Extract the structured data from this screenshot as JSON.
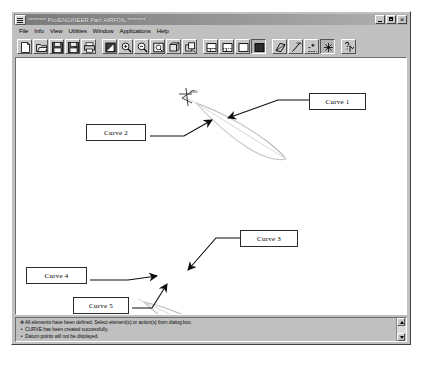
{
  "window": {
    "title": "******** Pro/ENGINEER Part: AIRFOIL ********",
    "sysmenu_name": "system-menu",
    "buttons": {
      "minimize": "_",
      "maximize": "□",
      "close": "×"
    }
  },
  "menubar": {
    "items": [
      {
        "label": "File"
      },
      {
        "label": "Info"
      },
      {
        "label": "View"
      },
      {
        "label": "Utilities"
      },
      {
        "label": "Window"
      },
      {
        "label": "Applications"
      },
      {
        "label": "Help"
      }
    ]
  },
  "toolbar": {
    "groups": [
      {
        "buttons": [
          {
            "icon": "new-file-icon",
            "tooltip": "New"
          },
          {
            "icon": "open-folder-icon",
            "tooltip": "Open"
          },
          {
            "icon": "save-icon",
            "tooltip": "Save"
          },
          {
            "icon": "save-as-icon",
            "tooltip": "Save As"
          },
          {
            "icon": "print-icon",
            "tooltip": "Print"
          }
        ]
      },
      {
        "buttons": [
          {
            "icon": "repaint-icon",
            "tooltip": "Repaint"
          },
          {
            "icon": "zoom-in-icon",
            "tooltip": "Zoom In"
          },
          {
            "icon": "zoom-out-icon",
            "tooltip": "Zoom Out"
          },
          {
            "icon": "refit-icon",
            "tooltip": "Refit"
          },
          {
            "icon": "reorient-icon",
            "tooltip": "Reorient"
          },
          {
            "icon": "saved-view-icon",
            "tooltip": "Saved View"
          }
        ]
      },
      {
        "buttons": [
          {
            "icon": "wireframe-icon",
            "tooltip": "Wireframe"
          },
          {
            "icon": "hidden-line-icon",
            "tooltip": "Hidden Line"
          },
          {
            "icon": "no-hidden-icon",
            "tooltip": "No Hidden"
          },
          {
            "icon": "shading-icon",
            "tooltip": "Shading",
            "pressed": true
          }
        ]
      },
      {
        "buttons": [
          {
            "icon": "datum-plane-icon",
            "tooltip": "Datum Planes"
          },
          {
            "icon": "datum-axis-icon",
            "tooltip": "Datum Axes"
          },
          {
            "icon": "datum-point-icon",
            "tooltip": "Datum Points"
          },
          {
            "icon": "datum-csys-icon",
            "tooltip": "Coordinate Systems",
            "pressed": true
          }
        ]
      },
      {
        "buttons": [
          {
            "icon": "context-help-icon",
            "tooltip": "Help"
          }
        ]
      }
    ]
  },
  "graphics": {
    "csys_label": "CS0",
    "callouts": [
      {
        "id": "callout-1",
        "label": "Curve 1"
      },
      {
        "id": "callout-2",
        "label": "Curve 2"
      },
      {
        "id": "callout-3",
        "label": "Curve 3"
      },
      {
        "id": "callout-4",
        "label": "Curve 4"
      },
      {
        "id": "callout-5",
        "label": "Curve 5"
      }
    ]
  },
  "messages": {
    "lines": [
      {
        "glyph": "✥",
        "text": "All elements have been defined. Select element(s) or action(s) from dialog box."
      },
      {
        "glyph": "•",
        "text": "CURVE has been created successfully."
      },
      {
        "glyph": "•",
        "text": "Datum points will not be displayed."
      }
    ]
  }
}
